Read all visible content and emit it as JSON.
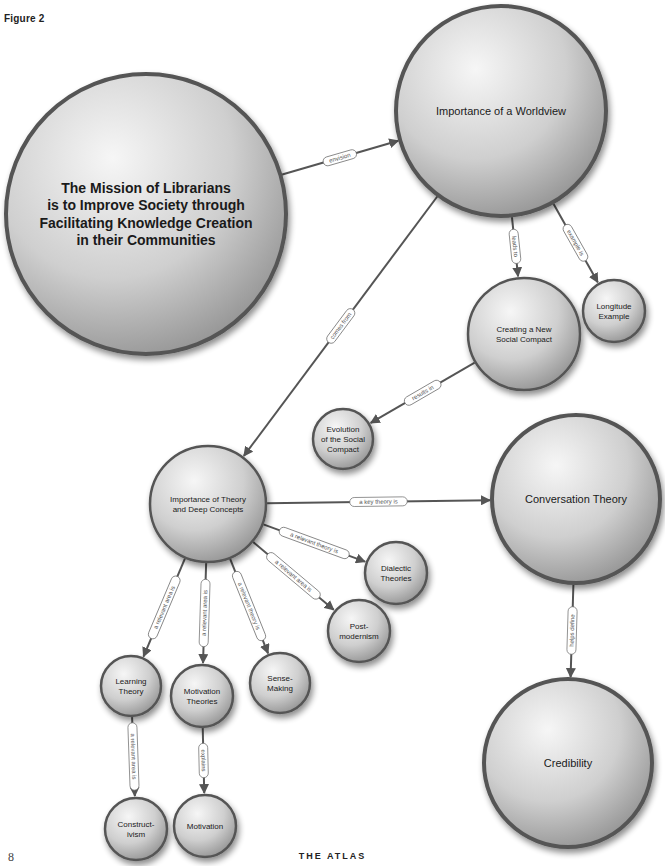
{
  "figure_label": "Figure 2",
  "page_number": "8",
  "footer_title": "THE ATLAS",
  "colors": {
    "node_fill_light": "#f4f4f4",
    "node_fill_dark": "#9a9a9a",
    "node_stroke": "#555555",
    "edge": "#555555",
    "background": "#ffffff"
  },
  "nodes": [
    {
      "id": "mission",
      "lines": [
        "The Mission of Librarians",
        "is to Improve Society through",
        "Facilitating Knowledge Creation",
        "in their Communities"
      ],
      "cx": 146,
      "cy": 214,
      "r": 140,
      "font_size": 14,
      "bold": true
    },
    {
      "id": "worldview",
      "lines": [
        "Importance of a Worldview"
      ],
      "cx": 501,
      "cy": 111,
      "r": 105,
      "font_size": 11,
      "bold": false
    },
    {
      "id": "social-compact",
      "lines": [
        "Creating a New",
        "Social Compact"
      ],
      "cx": 524,
      "cy": 334,
      "r": 56,
      "font_size": 8,
      "bold": false
    },
    {
      "id": "longitude",
      "lines": [
        "Longitude",
        "Example"
      ],
      "cx": 614,
      "cy": 311,
      "r": 31,
      "font_size": 8,
      "bold": false
    },
    {
      "id": "evolution",
      "lines": [
        "Evolution",
        "of the Social",
        "Compact"
      ],
      "cx": 343,
      "cy": 439,
      "r": 30,
      "font_size": 8,
      "bold": false
    },
    {
      "id": "theory",
      "lines": [
        "Importance of Theory",
        "and Deep Concepts"
      ],
      "cx": 208,
      "cy": 504,
      "r": 58,
      "font_size": 8,
      "bold": false
    },
    {
      "id": "conversation",
      "lines": [
        "Conversation Theory"
      ],
      "cx": 576,
      "cy": 499,
      "r": 84,
      "font_size": 11,
      "bold": false
    },
    {
      "id": "dialectic",
      "lines": [
        "Dialectic",
        "Theories"
      ],
      "cx": 396,
      "cy": 573,
      "r": 31,
      "font_size": 8,
      "bold": false
    },
    {
      "id": "postmodernism",
      "lines": [
        "Post-",
        "modernism"
      ],
      "cx": 359,
      "cy": 631,
      "r": 31,
      "font_size": 8,
      "bold": false
    },
    {
      "id": "sensemaking",
      "lines": [
        "Sense-",
        "Making"
      ],
      "cx": 280,
      "cy": 683,
      "r": 30,
      "font_size": 8,
      "bold": false
    },
    {
      "id": "learning",
      "lines": [
        "Learning",
        "Theory"
      ],
      "cx": 131,
      "cy": 686,
      "r": 30,
      "font_size": 8,
      "bold": false
    },
    {
      "id": "motivation-theories",
      "lines": [
        "Motivation",
        "Theories"
      ],
      "cx": 202,
      "cy": 696,
      "r": 31,
      "font_size": 8,
      "bold": false
    },
    {
      "id": "constructivism",
      "lines": [
        "Construct-",
        "ivism"
      ],
      "cx": 136,
      "cy": 829,
      "r": 31,
      "font_size": 8,
      "bold": false
    },
    {
      "id": "motivation",
      "lines": [
        "Motivation"
      ],
      "cx": 205,
      "cy": 826,
      "r": 31,
      "font_size": 8,
      "bold": false
    },
    {
      "id": "credibility",
      "lines": [
        "Credibility"
      ],
      "cx": 568,
      "cy": 763,
      "r": 84,
      "font_size": 11,
      "bold": false
    }
  ],
  "edges": [
    {
      "from": "mission",
      "to": "worldview",
      "label": "envision"
    },
    {
      "from": "worldview",
      "to": "social-compact",
      "label": "leads to"
    },
    {
      "from": "worldview",
      "to": "longitude",
      "label": "example is"
    },
    {
      "from": "worldview",
      "to": "theory",
      "label": "comes from"
    },
    {
      "from": "social-compact",
      "to": "evolution",
      "label": "results in"
    },
    {
      "from": "theory",
      "to": "conversation",
      "label": "a key theory is"
    },
    {
      "from": "theory",
      "to": "dialectic",
      "label": "a relevant theory is"
    },
    {
      "from": "theory",
      "to": "postmodernism",
      "label": "a relevant area is"
    },
    {
      "from": "theory",
      "to": "sensemaking",
      "label": "a relevant theory is"
    },
    {
      "from": "theory",
      "to": "motivation-theories",
      "label": "a relevant area is"
    },
    {
      "from": "theory",
      "to": "learning",
      "label": "a relevant area is"
    },
    {
      "from": "learning",
      "to": "constructivism",
      "label": "a relevant area is"
    },
    {
      "from": "motivation-theories",
      "to": "motivation",
      "label": "explains"
    },
    {
      "from": "conversation",
      "to": "credibility",
      "label": "helps define"
    }
  ]
}
